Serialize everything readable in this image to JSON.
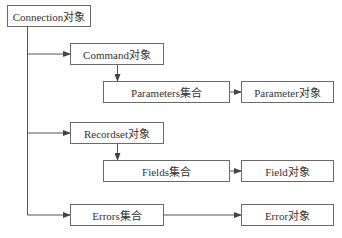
{
  "diagram": {
    "nodes": [
      {
        "id": "connection",
        "label": "Connection对象",
        "x": 7,
        "y": 5,
        "w": 84,
        "h": 22
      },
      {
        "id": "command",
        "label": "Command对象",
        "x": 70,
        "y": 43,
        "w": 94,
        "h": 22
      },
      {
        "id": "parameters",
        "label": "Parameters集合",
        "x": 103,
        "y": 81,
        "w": 127,
        "h": 22
      },
      {
        "id": "parameter",
        "label": "Parameter对象",
        "x": 241,
        "y": 81,
        "w": 93,
        "h": 22
      },
      {
        "id": "recordset",
        "label": "Recordset对象",
        "x": 70,
        "y": 122,
        "w": 94,
        "h": 22
      },
      {
        "id": "fields",
        "label": "Fields集合",
        "x": 103,
        "y": 160,
        "w": 127,
        "h": 22
      },
      {
        "id": "field",
        "label": "Field对象",
        "x": 241,
        "y": 160,
        "w": 93,
        "h": 22
      },
      {
        "id": "errors",
        "label": "Errors集合",
        "x": 70,
        "y": 204,
        "w": 94,
        "h": 22
      },
      {
        "id": "error",
        "label": "Error对象",
        "x": 241,
        "y": 204,
        "w": 93,
        "h": 22
      }
    ],
    "edges": [
      {
        "from": "connection",
        "to": "command"
      },
      {
        "from": "command",
        "to": "parameters"
      },
      {
        "from": "parameters",
        "to": "parameter"
      },
      {
        "from": "connection",
        "to": "recordset"
      },
      {
        "from": "recordset",
        "to": "fields"
      },
      {
        "from": "fields",
        "to": "field"
      },
      {
        "from": "connection",
        "to": "errors"
      },
      {
        "from": "errors",
        "to": "error"
      }
    ],
    "colors": {
      "line": "#555555",
      "border": "#6a6a6a",
      "text": "#333333"
    }
  }
}
